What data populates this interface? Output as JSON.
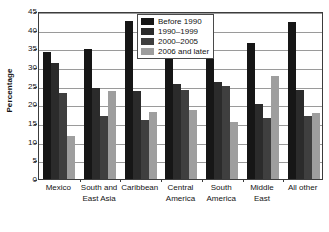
{
  "chart_data": {
    "type": "bar",
    "title": "",
    "subtitle": "",
    "xlabel": "",
    "ylabel": "Percentage",
    "ylim": [
      0,
      45
    ],
    "ytick_step": 5,
    "yticks": [
      45,
      40,
      35,
      30,
      25,
      20,
      15,
      10,
      5,
      0
    ],
    "grid": true,
    "legend_position": "top-center",
    "categories": [
      "Mexico",
      "South and East Asia",
      "Caribbean",
      "Central America",
      "South America",
      "Middle East",
      "All other"
    ],
    "category_lines": [
      [
        "Mexico"
      ],
      [
        "South and",
        "East Asia"
      ],
      [
        "Caribbean"
      ],
      [
        "Central",
        "America"
      ],
      [
        "South",
        "America"
      ],
      [
        "Middle",
        "East"
      ],
      [
        "All other"
      ]
    ],
    "series": [
      {
        "name": "Before 1990",
        "color": "#161616",
        "values": [
          34.1,
          34.9,
          42.4,
          32.5,
          33.4,
          36.5,
          42.0
        ]
      },
      {
        "name": "1990–1999",
        "color": "#2b2b2b",
        "values": [
          31.0,
          24.5,
          23.6,
          25.5,
          26.1,
          20.1,
          23.9
        ]
      },
      {
        "name": "2000–2005",
        "color": "#3f3f3f",
        "values": [
          23.0,
          16.8,
          15.9,
          23.8,
          25.0,
          16.3,
          16.8
        ]
      },
      {
        "name": "2006 and later",
        "color": "#9e9e9e",
        "values": [
          11.5,
          23.6,
          17.9,
          18.4,
          15.4,
          27.5,
          17.8
        ]
      }
    ]
  },
  "legend": {
    "items": [
      {
        "label": "Before 1990",
        "color": "#161616"
      },
      {
        "label": "1990–1999",
        "color": "#2b2b2b"
      },
      {
        "label": "2000–2005",
        "color": "#3f3f3f"
      },
      {
        "label": "2006 and later",
        "color": "#9e9e9e"
      }
    ]
  },
  "axes": {
    "y_title": "Percentage",
    "y_tick_labels": [
      "45",
      "40",
      "35",
      "30",
      "25",
      "20",
      "15",
      "10",
      "5",
      "0"
    ]
  },
  "colors": {
    "axis": "#3c3c3c",
    "gridline": "#9a9a9a",
    "text": "#141414",
    "background": "#ffffff"
  }
}
